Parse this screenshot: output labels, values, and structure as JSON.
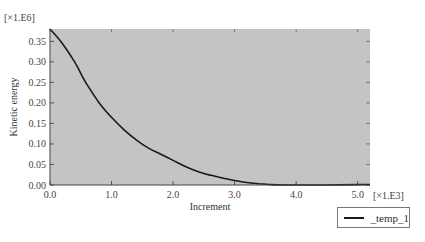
{
  "chart_data": {
    "type": "line",
    "title": "",
    "xlabel": "Increment",
    "ylabel": "Kinetic energy",
    "x_multiplier": "[×1.E3]",
    "y_multiplier": "[×1.E6]",
    "xlim": [
      0.0,
      5.2
    ],
    "ylim": [
      0.0,
      0.38
    ],
    "x_ticks": [
      "0.0",
      "1.0",
      "2.0",
      "3.0",
      "4.0",
      "5.0"
    ],
    "y_ticks": [
      "0.00",
      "0.05",
      "0.10",
      "0.15",
      "0.20",
      "0.25",
      "0.30",
      "0.35"
    ],
    "grid": false,
    "plot_background": "#c4c4c4",
    "line_color": "#1a1a1a",
    "legend_position": "bottom-right outside",
    "series": [
      {
        "name": "_temp_1",
        "x": [
          0.0,
          0.2,
          0.4,
          0.5,
          0.6,
          0.8,
          1.0,
          1.2,
          1.4,
          1.6,
          1.8,
          2.0,
          2.2,
          2.4,
          2.6,
          2.8,
          3.0,
          3.2,
          3.4,
          3.6,
          3.8,
          4.0,
          4.5,
          5.0,
          5.2
        ],
        "y": [
          0.38,
          0.345,
          0.3,
          0.272,
          0.245,
          0.2,
          0.165,
          0.135,
          0.11,
          0.09,
          0.075,
          0.06,
          0.045,
          0.033,
          0.024,
          0.017,
          0.011,
          0.006,
          0.003,
          0.001,
          0.0,
          0.0,
          0.0,
          0.001,
          0.001
        ]
      }
    ]
  },
  "legend": {
    "items": [
      {
        "label": "_temp_1"
      }
    ]
  }
}
